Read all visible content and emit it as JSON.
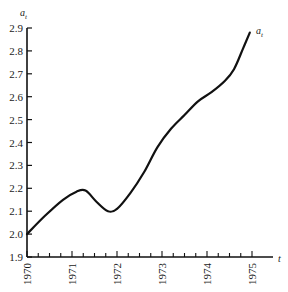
{
  "chart_data": {
    "type": "line",
    "title": "",
    "xlabel": "t",
    "ylabel": "a_t",
    "series_label": "a_t",
    "xlim": [
      1970,
      1975.5
    ],
    "ylim": [
      1.9,
      2.9
    ],
    "grid": false,
    "legend": "none",
    "x_ticks": [
      "1970",
      "1971",
      "1972",
      "1973",
      "1974",
      "1975"
    ],
    "y_ticks": [
      "1.9",
      "2.0",
      "2.1",
      "2.2",
      "2.3",
      "2.4",
      "2.5",
      "2.6",
      "2.7",
      "2.8",
      "2.9"
    ],
    "series": [
      {
        "name": "a_t",
        "x": [
          1970.0,
          1970.4,
          1970.8,
          1971.1,
          1971.3,
          1971.55,
          1971.8,
          1972.0,
          1972.3,
          1972.6,
          1972.9,
          1973.2,
          1973.5,
          1973.8,
          1974.1,
          1974.4,
          1974.6,
          1974.8,
          1974.95
        ],
        "values": [
          2.0,
          2.08,
          2.15,
          2.185,
          2.19,
          2.14,
          2.1,
          2.11,
          2.18,
          2.27,
          2.38,
          2.46,
          2.52,
          2.58,
          2.62,
          2.67,
          2.72,
          2.81,
          2.88
        ]
      }
    ]
  }
}
